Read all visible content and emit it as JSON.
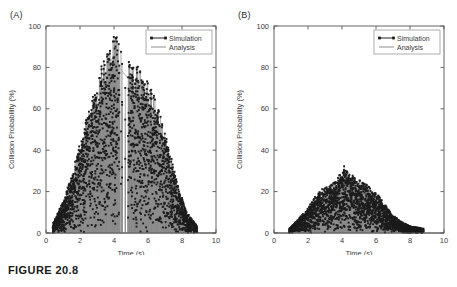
{
  "figure": {
    "caption": "FIGURE 20.8",
    "background_color": "#ffffff"
  },
  "panels": [
    {
      "id": "panel-a",
      "label": "(A)"
    },
    {
      "id": "panel-b",
      "label": "(B)"
    }
  ],
  "legend": {
    "items": [
      {
        "label": "Simulation",
        "style": "line-with-square-markers",
        "color": "#1c1c1c"
      },
      {
        "label": "Analysis",
        "style": "line",
        "color": "#9e9e9e"
      }
    ],
    "position": "top-right"
  },
  "chart_data": [
    {
      "type": "scatter",
      "panel": "(A)",
      "title": "",
      "xlabel": "Time (s)",
      "ylabel": "Collision Probability (%)",
      "xlim": [
        0,
        10
      ],
      "ylim": [
        0,
        100
      ],
      "xticks": [
        0,
        2,
        4,
        6,
        8,
        10
      ],
      "yticks": [
        0,
        20,
        40,
        60,
        80,
        100
      ],
      "grid": false,
      "legend": [
        "Simulation",
        "Analysis"
      ],
      "legend_position": "upper right",
      "description": "Dense stem-and-marker cloud forming a broad unimodal hump peaking near t = 4 s at about 90%, with a narrow vertical gap (no data) between roughly t = 4.3 and t = 4.8 s. Data spans t = 0.4 to t = 8.9 s.",
      "series": [
        {
          "name": "Simulation",
          "style": "squares",
          "envelope_x": [
            0.4,
            1.0,
            1.5,
            2.0,
            2.5,
            3.0,
            3.5,
            4.0,
            4.3,
            4.9,
            5.3,
            5.8,
            6.3,
            6.8,
            7.3,
            7.8,
            8.3,
            8.9
          ],
          "envelope_upper": [
            4,
            14,
            26,
            40,
            54,
            68,
            80,
            90,
            84,
            78,
            75,
            70,
            62,
            50,
            36,
            20,
            9,
            3
          ],
          "envelope_lower": [
            0,
            0,
            0,
            0,
            0,
            0,
            0,
            0,
            0,
            0,
            0,
            0,
            0,
            0,
            0,
            0,
            0,
            0
          ],
          "peak_x": 4.0,
          "peak_y": 90
        },
        {
          "name": "Analysis",
          "style": "line",
          "envelope_x": [
            0.4,
            1.0,
            1.5,
            2.0,
            2.5,
            3.0,
            3.5,
            4.0,
            4.3,
            4.9,
            5.3,
            5.8,
            6.3,
            6.8,
            7.3,
            7.8,
            8.3,
            8.9
          ],
          "envelope_upper": [
            3,
            12,
            24,
            38,
            52,
            65,
            77,
            86,
            80,
            74,
            71,
            66,
            58,
            47,
            33,
            18,
            8,
            2
          ]
        }
      ]
    },
    {
      "type": "scatter",
      "panel": "(B)",
      "title": "",
      "xlabel": "Time (s)",
      "ylabel": "Collision Probability (%)",
      "xlim": [
        0,
        10
      ],
      "ylim": [
        0,
        100
      ],
      "xticks": [
        0,
        2,
        4,
        6,
        8,
        10
      ],
      "yticks": [
        0,
        20,
        40,
        60,
        80,
        100
      ],
      "grid": false,
      "legend": [
        "Simulation",
        "Analysis"
      ],
      "legend_position": "upper right",
      "description": "Low-amplitude stem-and-marker cloud hugging the baseline, peaking near t = 4.1 s at about 30%. Data spans t = 0.9 to t = 8.8 s with a few isolated points near t = 8.7.",
      "series": [
        {
          "name": "Simulation",
          "style": "squares",
          "envelope_x": [
            0.9,
            1.4,
            1.9,
            2.4,
            2.9,
            3.4,
            3.8,
            4.1,
            4.5,
            5.0,
            5.5,
            6.0,
            6.5,
            7.0,
            7.5,
            8.0,
            8.8
          ],
          "envelope_upper": [
            2,
            6,
            10,
            16,
            20,
            22,
            25,
            30,
            26,
            24,
            22,
            18,
            13,
            8,
            5,
            3,
            2
          ],
          "envelope_lower": [
            0,
            0,
            0,
            0,
            0,
            0,
            0,
            0,
            0,
            0,
            0,
            0,
            0,
            0,
            0,
            0,
            0
          ],
          "peak_x": 4.1,
          "peak_y": 30
        },
        {
          "name": "Analysis",
          "style": "line",
          "envelope_x": [
            0.9,
            1.4,
            1.9,
            2.4,
            2.9,
            3.4,
            3.8,
            4.1,
            4.5,
            5.0,
            5.5,
            6.0,
            6.5,
            7.0,
            7.5,
            8.0,
            8.8
          ],
          "envelope_upper": [
            1,
            5,
            9,
            14,
            18,
            20,
            23,
            27,
            24,
            22,
            20,
            16,
            11,
            7,
            4,
            2,
            1
          ]
        }
      ]
    }
  ]
}
